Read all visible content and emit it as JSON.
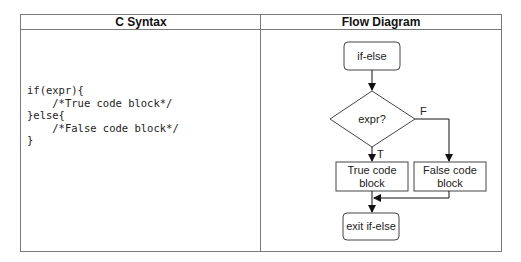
{
  "table": {
    "headers": [
      "C Syntax",
      "Flow Diagram"
    ]
  },
  "code": {
    "lines": [
      "if(expr){",
      "    /*True code block*/",
      "}else{",
      "    /*False code block*/",
      "}"
    ],
    "text": "if(expr){\n    /*True code block*/\n}else{\n    /*False code block*/\n}"
  },
  "flow": {
    "start": "if-else",
    "decision": "expr?",
    "true_label": "T",
    "false_label": "F",
    "true_block": [
      "True code",
      "block"
    ],
    "false_block": [
      "False code",
      "block"
    ],
    "end": "exit if-else"
  },
  "colors": {
    "border": "#7a7a7a",
    "line": "#222222"
  }
}
